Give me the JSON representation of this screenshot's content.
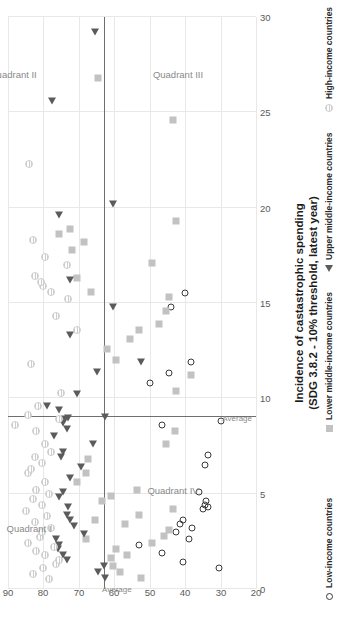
{
  "chart_data": {
    "type": "scatter",
    "title": "",
    "xlabel": "Incidence of castastrophic spending (SDG 3.8.2 - 10% threshold, latest year)",
    "xlabel_line1": "Incidence of castastrophic spending",
    "xlabel_line2": "(SDG 3.8.2 - 10% threshold, latest year)",
    "ylabel": "",
    "xlim": [
      0,
      30
    ],
    "ylim": [
      20,
      90
    ],
    "xticks": [
      0,
      5,
      10,
      15,
      20,
      25,
      30
    ],
    "yticks": [
      20,
      30,
      40,
      50,
      60,
      70,
      80,
      90
    ],
    "grid": true,
    "legend_position": "right",
    "orientation": "rotated-90ccw",
    "average_x": 9.0,
    "average_y": 63.0,
    "average_label": "Average",
    "quadrants": [
      {
        "name": "Quadrant I",
        "x": 3.2,
        "y": 84.0
      },
      {
        "name": "Quadrant II",
        "x": 27.0,
        "y": 88.5
      },
      {
        "name": "Quadrant III",
        "x": 27.0,
        "y": 42.0
      },
      {
        "name": "Quadrant IV",
        "x": 5.2,
        "y": 43.5
      }
    ],
    "series": [
      {
        "name": "Low-income countries",
        "marker": "open-circle",
        "color": "#3a3a3a",
        "points": [
          [
            1.4,
            40.5
          ],
          [
            1.1,
            30.5
          ],
          [
            1.9,
            46.5
          ],
          [
            2.3,
            53.0
          ],
          [
            2.6,
            39.0
          ],
          [
            3.0,
            42.5
          ],
          [
            3.2,
            38.0
          ],
          [
            3.4,
            41.5
          ],
          [
            3.6,
            40.5
          ],
          [
            4.2,
            35.0
          ],
          [
            4.3,
            33.5
          ],
          [
            4.4,
            34.5
          ],
          [
            4.6,
            34.0
          ],
          [
            5.1,
            36.0
          ],
          [
            6.5,
            34.5
          ],
          [
            7.0,
            33.5
          ],
          [
            8.6,
            46.5
          ],
          [
            8.8,
            30.0
          ],
          [
            10.8,
            50.0
          ],
          [
            11.3,
            44.5
          ],
          [
            11.9,
            38.5
          ],
          [
            14.8,
            44.0
          ],
          [
            15.5,
            40.0
          ]
        ]
      },
      {
        "name": "Lower middle-income countries",
        "marker": "square",
        "color": "#c2c2c2",
        "points": [
          [
            0.6,
            52.5
          ],
          [
            0.9,
            58.5
          ],
          [
            1.2,
            60.5
          ],
          [
            1.6,
            61.0
          ],
          [
            1.8,
            56.5
          ],
          [
            2.1,
            59.5
          ],
          [
            2.4,
            49.5
          ],
          [
            2.6,
            68.0
          ],
          [
            2.8,
            46.0
          ],
          [
            3.1,
            44.5
          ],
          [
            3.4,
            57.0
          ],
          [
            3.6,
            65.5
          ],
          [
            3.9,
            53.0
          ],
          [
            4.2,
            43.5
          ],
          [
            4.6,
            63.5
          ],
          [
            4.9,
            61.0
          ],
          [
            5.2,
            53.5
          ],
          [
            5.6,
            70.5
          ],
          [
            6.1,
            68.0
          ],
          [
            6.8,
            67.5
          ],
          [
            7.6,
            45.5
          ],
          [
            8.3,
            43.0
          ],
          [
            10.4,
            42.5
          ],
          [
            11.2,
            38.5
          ],
          [
            12.0,
            59.5
          ],
          [
            12.6,
            62.0
          ],
          [
            13.1,
            55.5
          ],
          [
            13.6,
            53.0
          ],
          [
            13.9,
            47.5
          ],
          [
            14.6,
            45.5
          ],
          [
            15.3,
            44.5
          ],
          [
            15.6,
            66.5
          ],
          [
            16.3,
            70.5
          ],
          [
            17.1,
            49.5
          ],
          [
            17.8,
            72.0
          ],
          [
            18.2,
            68.5
          ],
          [
            18.6,
            75.5
          ],
          [
            18.9,
            72.5
          ],
          [
            19.3,
            42.5
          ],
          [
            24.6,
            43.5
          ],
          [
            26.8,
            64.5
          ]
        ]
      },
      {
        "name": "Upper middle-income countries",
        "marker": "triangle",
        "color": "#5b5b5b",
        "points": [
          [
            0.6,
            62.5
          ],
          [
            0.9,
            64.5
          ],
          [
            1.2,
            63.0
          ],
          [
            1.5,
            73.5
          ],
          [
            1.8,
            74.5
          ],
          [
            2.1,
            76.0
          ],
          [
            2.3,
            75.5
          ],
          [
            2.6,
            76.5
          ],
          [
            2.9,
            68.5
          ],
          [
            3.3,
            71.5
          ],
          [
            3.6,
            72.5
          ],
          [
            3.9,
            73.5
          ],
          [
            4.3,
            73.0
          ],
          [
            4.8,
            75.5
          ],
          [
            5.1,
            74.5
          ],
          [
            5.8,
            72.5
          ],
          [
            6.4,
            69.5
          ],
          [
            6.9,
            75.0
          ],
          [
            7.2,
            74.5
          ],
          [
            7.6,
            66.0
          ],
          [
            8.0,
            77.0
          ],
          [
            8.4,
            73.5
          ],
          [
            8.7,
            74.5
          ],
          [
            8.9,
            74.0
          ],
          [
            8.95,
            73.0
          ],
          [
            9.0,
            62.5
          ],
          [
            9.4,
            75.5
          ],
          [
            9.6,
            79.0
          ],
          [
            10.2,
            70.5
          ],
          [
            11.4,
            65.0
          ],
          [
            11.9,
            52.5
          ],
          [
            13.3,
            72.5
          ],
          [
            14.8,
            60.5
          ],
          [
            16.2,
            72.5
          ],
          [
            19.6,
            75.5
          ],
          [
            20.2,
            60.5
          ],
          [
            25.6,
            77.5
          ],
          [
            29.2,
            65.5
          ]
        ]
      },
      {
        "name": "High-income countries",
        "marker": "hatched-circle",
        "color": "#cdcdcd",
        "points": [
          [
            0.5,
            78.5
          ],
          [
            0.8,
            83.0
          ],
          [
            1.1,
            80.0
          ],
          [
            1.3,
            76.5
          ],
          [
            1.5,
            75.5
          ],
          [
            1.8,
            79.5
          ],
          [
            2.0,
            82.0
          ],
          [
            2.2,
            77.0
          ],
          [
            2.4,
            84.5
          ],
          [
            2.7,
            81.0
          ],
          [
            3.0,
            80.5
          ],
          [
            3.2,
            78.0
          ],
          [
            3.5,
            82.5
          ],
          [
            3.8,
            79.0
          ],
          [
            4.1,
            85.0
          ],
          [
            4.4,
            80.5
          ],
          [
            4.7,
            83.0
          ],
          [
            5.0,
            78.5
          ],
          [
            5.2,
            82.0
          ],
          [
            5.6,
            79.5
          ],
          [
            6.1,
            84.5
          ],
          [
            6.3,
            83.5
          ],
          [
            6.6,
            80.5
          ],
          [
            6.9,
            82.5
          ],
          [
            7.2,
            78.0
          ],
          [
            7.6,
            79.5
          ],
          [
            8.3,
            82.0
          ],
          [
            8.6,
            88.0
          ],
          [
            8.9,
            75.5
          ],
          [
            9.1,
            84.5
          ],
          [
            9.6,
            81.5
          ],
          [
            10.3,
            75.0
          ],
          [
            11.8,
            83.5
          ],
          [
            13.6,
            70.5
          ],
          [
            14.3,
            76.5
          ],
          [
            15.2,
            73.0
          ],
          [
            15.6,
            78.0
          ],
          [
            15.9,
            80.0
          ],
          [
            16.1,
            80.8
          ],
          [
            16.4,
            82.5
          ],
          [
            17.0,
            73.5
          ],
          [
            17.4,
            79.5
          ],
          [
            18.3,
            83.0
          ],
          [
            22.3,
            84.0
          ]
        ]
      }
    ]
  },
  "legend": {
    "items": [
      {
        "label": "Low-income countries",
        "marker": "open-circle"
      },
      {
        "label": "Lower middle-income countries",
        "marker": "square"
      },
      {
        "label": "Upper middle-income countries",
        "marker": "triangle"
      },
      {
        "label": "High-income countries",
        "marker": "hatched-circle"
      }
    ]
  }
}
